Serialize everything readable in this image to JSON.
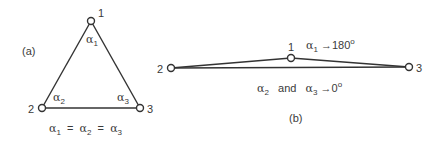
{
  "colors": {
    "line": "#333333",
    "text": "#3a3a3a",
    "background": "#ffffff"
  },
  "panel_a": {
    "label": "(a)",
    "nodes": [
      {
        "id": "1",
        "label": "1",
        "x": 91,
        "y": 21
      },
      {
        "id": "2",
        "label": "2",
        "x": 42,
        "y": 108
      },
      {
        "id": "3",
        "label": "3",
        "x": 140,
        "y": 108
      }
    ],
    "angles": [
      {
        "symbol": "α",
        "sub": "1"
      },
      {
        "symbol": "α",
        "sub": "2"
      },
      {
        "symbol": "α",
        "sub": "3"
      }
    ],
    "caption": {
      "a1": "α",
      "s1": "1",
      "eq1": "=",
      "a2": "α",
      "s2": "2",
      "eq2": "=",
      "a3": "α",
      "s3": "3"
    }
  },
  "panel_b": {
    "label": "(b)",
    "nodes": [
      {
        "id": "1",
        "label": "1",
        "x": 291,
        "y": 58
      },
      {
        "id": "2",
        "label": "2",
        "x": 171,
        "y": 68
      },
      {
        "id": "3",
        "label": "3",
        "x": 409,
        "y": 67
      }
    ],
    "top_annotation": {
      "symbol": "α",
      "sub": "1",
      "arrow": "→",
      "value": "180",
      "sup": "o"
    },
    "bottom_annotation": {
      "a2": "α",
      "s2": "2",
      "and": "and",
      "a3": "α",
      "s3": "3",
      "arrow": "→",
      "value": "0",
      "sup": "o"
    }
  }
}
